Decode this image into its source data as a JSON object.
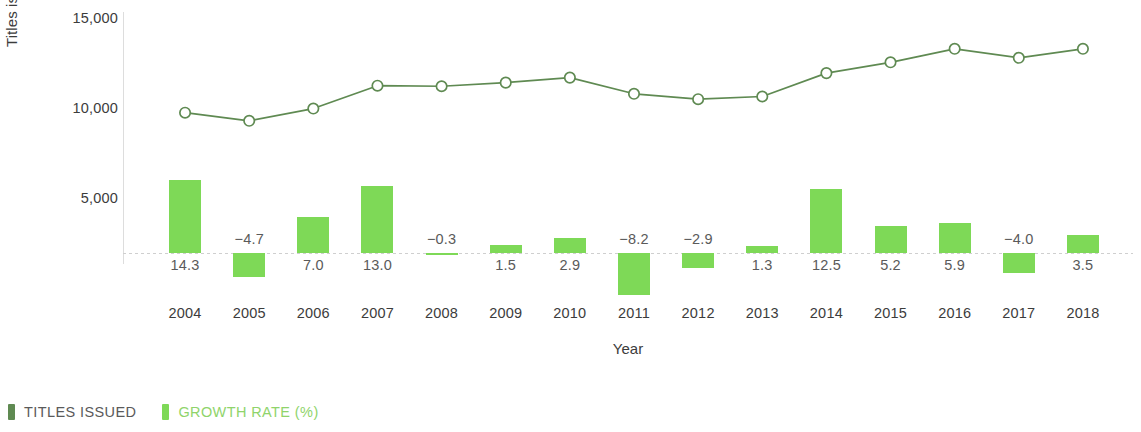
{
  "chart_data": {
    "type": "bar",
    "title": "",
    "subtitle": "",
    "xlabel": "Year",
    "ylabel": "Titles issued",
    "categories": [
      "2004",
      "2005",
      "2006",
      "2007",
      "2008",
      "2009",
      "2010",
      "2011",
      "2012",
      "2013",
      "2014",
      "2015",
      "2016",
      "2017",
      "2018"
    ],
    "y_ticks": [
      "15,000",
      "10,000",
      "5,000"
    ],
    "y_tick_values": [
      15000,
      10000,
      5000
    ],
    "ylim": [
      0,
      15000
    ],
    "grid": false,
    "legend_position": "bottom-left",
    "series": [
      {
        "name": "TITLES ISSUED",
        "type": "line",
        "axis": "left",
        "color": "#5f8a52",
        "marker": "open-circle",
        "values": [
          9850,
          9400,
          10080,
          11350,
          11320,
          11520,
          11800,
          10900,
          10600,
          10750,
          12050,
          12650,
          13400,
          12900,
          13400
        ]
      },
      {
        "name": "GROWTH RATE (%)",
        "type": "bar",
        "axis": "right",
        "color": "#7ed957",
        "values": [
          14.3,
          -4.7,
          7.0,
          13.0,
          -0.3,
          1.5,
          2.9,
          -8.2,
          -2.9,
          1.3,
          12.5,
          5.2,
          5.9,
          -4.0,
          3.5
        ],
        "labels": [
          "14.3",
          "−4.7",
          "7.0",
          "13.0",
          "−0.3",
          "1.5",
          "2.9",
          "−8.2",
          "−2.9",
          "1.3",
          "12.5",
          "5.2",
          "5.9",
          "−4.0",
          "3.5"
        ]
      }
    ]
  },
  "legend": {
    "items": [
      {
        "label": "TITLES ISSUED",
        "color": "#5f8a52",
        "text_color": "#5a5a5a"
      },
      {
        "label": "GROWTH RATE (%)",
        "color": "#7ed957",
        "text_color": "#8fd46b"
      }
    ]
  },
  "colors": {
    "bar": "#7ed957",
    "line": "#5f8a52",
    "axis": "#dddddd",
    "text": "#3c3c3c",
    "background": "#ffffff"
  }
}
